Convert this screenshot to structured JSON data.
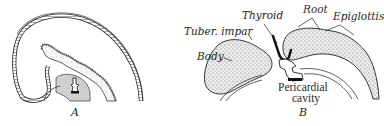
{
  "figure": {
    "panels": [
      {
        "id": "A",
        "label": "A"
      },
      {
        "id": "B",
        "label": "B"
      }
    ],
    "labels": {
      "thyroid": "Thyroid",
      "root": "Root",
      "epiglottis": "Epiglottis",
      "tuber_impar": "Tuber. impar",
      "body": "Body",
      "pericardial": "Pericardial",
      "cavity": "cavity"
    }
  },
  "colors": {
    "ink": "#1e1e1e",
    "stipple_fill": "#d9d9d9",
    "background": "#ffffff"
  }
}
